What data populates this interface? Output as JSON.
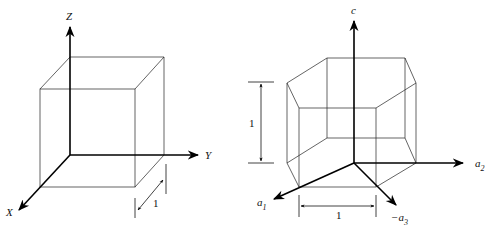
{
  "left_figure": {
    "name": "cubic unit cell",
    "axes": {
      "z": "Z",
      "y": "Y",
      "x": "X"
    },
    "dimension_label": "1"
  },
  "right_figure": {
    "name": "hexagonal unit cell",
    "axes": {
      "c": "c",
      "a2": "a",
      "a2_sub": "2",
      "a1": "a",
      "a1_sub": "1",
      "a3": "−a",
      "a3_sub": "3"
    },
    "height_label": "1",
    "width_label": "1"
  }
}
